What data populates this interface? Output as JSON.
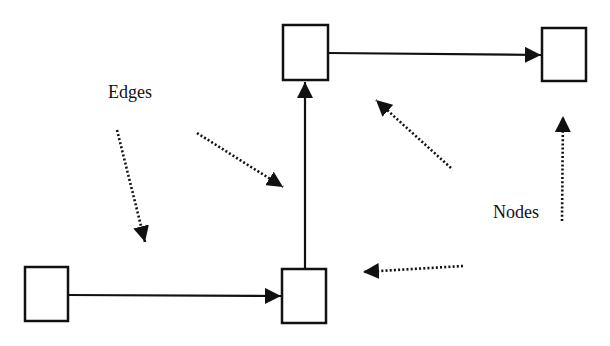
{
  "diagram": {
    "type": "graph-annotation",
    "labels": {
      "edges": "Edges",
      "nodes": "Nodes"
    },
    "colors": {
      "stroke": "#111111",
      "background": "#ffffff",
      "node_fill": "#ffffff"
    },
    "nodes": [
      {
        "id": "top-middle",
        "x": 283,
        "y": 25,
        "w": 45,
        "h": 55
      },
      {
        "id": "top-right",
        "x": 542,
        "y": 28,
        "w": 44,
        "h": 53
      },
      {
        "id": "bottom-left",
        "x": 25,
        "y": 267,
        "w": 43,
        "h": 54
      },
      {
        "id": "bottom-middle",
        "x": 282,
        "y": 269,
        "w": 44,
        "h": 54
      }
    ],
    "edges": [
      {
        "from": "bottom-left",
        "to": "bottom-middle",
        "direction": "right"
      },
      {
        "from": "bottom-middle",
        "to": "top-middle",
        "direction": "up"
      },
      {
        "from": "top-middle",
        "to": "top-right",
        "direction": "right"
      }
    ],
    "pointers": [
      {
        "label": "Edges",
        "target": "edge bottom-left→bottom-middle"
      },
      {
        "label": "Edges",
        "target": "edge bottom-middle→top-middle"
      },
      {
        "label": "Nodes",
        "target": "node top-middle"
      },
      {
        "label": "Nodes",
        "target": "node top-right"
      },
      {
        "label": "Nodes",
        "target": "node bottom-middle"
      }
    ]
  }
}
